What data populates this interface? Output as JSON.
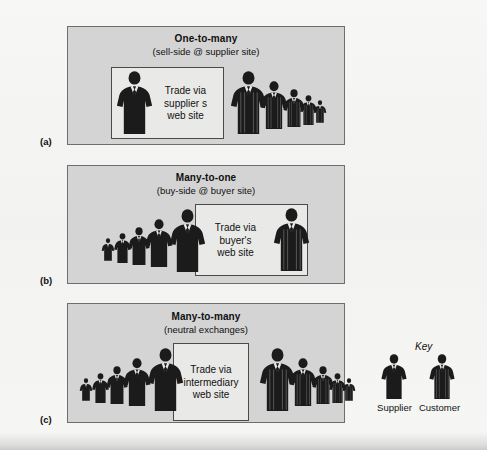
{
  "figure": {
    "width": 487,
    "height": 450,
    "background_color": "#f4f4f2",
    "panel_fill": "#d4d4d4",
    "panel_border": "#6e6e6e",
    "inner_box_fill": "#e9e9e7",
    "inner_box_border": "#4a4a4a",
    "figure_color": "#1b1b1b"
  },
  "panels": [
    {
      "letter": "(a)",
      "title": "One-to-many",
      "subtitle": "(sell-side @ supplier site)",
      "box_text_lines": [
        "Trade via",
        "supplier s",
        "web site"
      ],
      "box_side": "left",
      "box": {
        "x": 110,
        "y": 66,
        "w": 113,
        "h": 72
      },
      "rect": {
        "x": 67,
        "y": 26,
        "w": 278,
        "h": 119
      },
      "title_y": 32,
      "subtitle_y": 45,
      "letter_pos": {
        "x": 40,
        "y": 136
      },
      "groups": [
        {
          "role": "supplier",
          "count": 1,
          "order": "single",
          "people": [
            {
              "x": 115,
              "y": 71,
              "h": 63
            }
          ]
        },
        {
          "role": "customer",
          "count": 5,
          "order": "descending",
          "people": [
            {
              "x": 229,
              "y": 71,
              "h": 63
            },
            {
              "x": 259,
              "y": 81,
              "h": 48
            },
            {
              "x": 282,
              "y": 89,
              "h": 38
            },
            {
              "x": 299,
              "y": 95,
              "h": 30
            },
            {
              "x": 313,
              "y": 100,
              "h": 23
            }
          ]
        }
      ]
    },
    {
      "letter": "(b)",
      "title": "Many-to-one",
      "subtitle": "(buy-side @ buyer site)",
      "box_text_lines": [
        "Trade via",
        "buyer's",
        "web site"
      ],
      "box_side": "right",
      "box": {
        "x": 194,
        "y": 203,
        "w": 113,
        "h": 72
      },
      "rect": {
        "x": 67,
        "y": 165,
        "w": 278,
        "h": 119
      },
      "title_y": 171,
      "subtitle_y": 184,
      "letter_pos": {
        "x": 40,
        "y": 275
      },
      "groups": [
        {
          "role": "supplier",
          "count": 5,
          "order": "ascending",
          "people": [
            {
              "x": 101,
              "y": 238,
              "h": 23
            },
            {
              "x": 113,
              "y": 233,
              "h": 30
            },
            {
              "x": 127,
              "y": 227,
              "h": 38
            },
            {
              "x": 144,
              "y": 219,
              "h": 48
            },
            {
              "x": 168,
              "y": 209,
              "h": 63
            }
          ]
        },
        {
          "role": "customer",
          "count": 1,
          "order": "single",
          "people": [
            {
              "x": 272,
              "y": 208,
              "h": 63
            }
          ]
        }
      ]
    },
    {
      "letter": "(c)",
      "title": "Many-to-many",
      "subtitle": "(neutral exchanges)",
      "box_text_lines": [
        "Trade via",
        "intermediary",
        "web site"
      ],
      "box_side": "center",
      "box": {
        "x": 172,
        "y": 342,
        "w": 76,
        "h": 78
      },
      "rect": {
        "x": 67,
        "y": 303,
        "w": 278,
        "h": 120
      },
      "title_y": 310,
      "subtitle_y": 323,
      "letter_pos": {
        "x": 40,
        "y": 414
      },
      "groups": [
        {
          "role": "supplier",
          "count": 5,
          "order": "ascending",
          "people": [
            {
              "x": 79,
              "y": 378,
              "h": 23
            },
            {
              "x": 91,
              "y": 373,
              "h": 30
            },
            {
              "x": 105,
              "y": 366,
              "h": 38
            },
            {
              "x": 122,
              "y": 358,
              "h": 48
            },
            {
              "x": 146,
              "y": 348,
              "h": 63
            }
          ]
        },
        {
          "role": "customer",
          "count": 5,
          "order": "descending",
          "people": [
            {
              "x": 258,
              "y": 348,
              "h": 63
            },
            {
              "x": 288,
              "y": 358,
              "h": 48
            },
            {
              "x": 311,
              "y": 366,
              "h": 38
            },
            {
              "x": 328,
              "y": 373,
              "h": 30
            },
            {
              "x": 342,
              "y": 378,
              "h": 23
            }
          ]
        }
      ]
    }
  ],
  "key": {
    "title": "Key",
    "title_pos": {
      "x": 415,
      "y": 341
    },
    "items": [
      {
        "label": "Supplier",
        "role": "supplier",
        "person": {
          "x": 380,
          "y": 354,
          "h": 45
        },
        "label_pos": {
          "x": 367,
          "y": 402
        }
      },
      {
        "label": "Customer",
        "role": "customer",
        "person": {
          "x": 428,
          "y": 354,
          "h": 45
        },
        "label_pos": {
          "x": 412,
          "y": 402
        }
      }
    ]
  }
}
